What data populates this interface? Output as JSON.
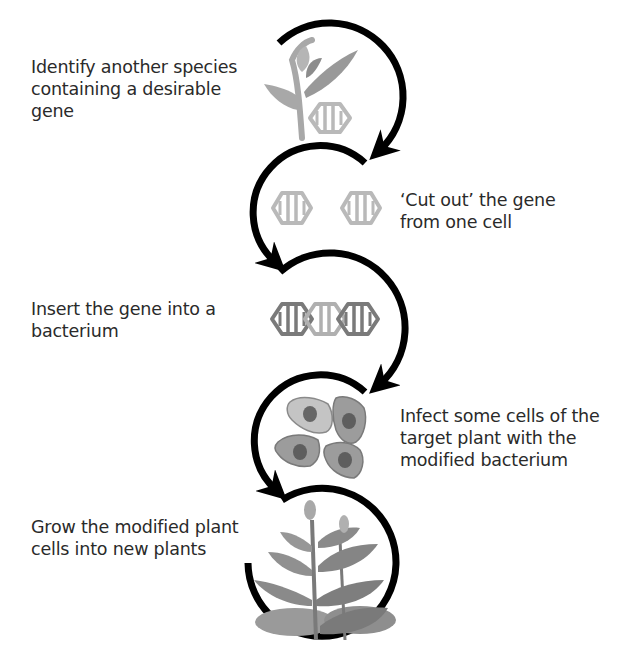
{
  "diagram": {
    "type": "process-flow",
    "title": "",
    "colors": {
      "arrow": "#000000",
      "text": "#2a2a2a",
      "gene_light": "#b9b9b9",
      "gene_dark": "#7a7a7a",
      "plant_light": "#a8a8a8",
      "plant_dark": "#6d6d6d",
      "cell_light": "#c4c4c4",
      "cell_mid": "#9c9c9c",
      "nucleus": "#666666"
    },
    "steps": [
      {
        "id": 1,
        "text": "Identify another species\ncontaining a desirable\ngene",
        "icon": "plant-with-gene-icon",
        "side": "left"
      },
      {
        "id": 2,
        "text": "‘Cut out’ the gene\nfrom one cell",
        "icon": "cut-gene-icon",
        "side": "right"
      },
      {
        "id": 3,
        "text": "Insert the gene into a\nbacterium",
        "icon": "recombinant-dna-icon",
        "side": "left"
      },
      {
        "id": 4,
        "text": "Infect some cells of the\ntarget plant with the\nmodified bacterium",
        "icon": "plant-cells-icon",
        "side": "right"
      },
      {
        "id": 5,
        "text": "Grow the modified plant\ncells into new plants",
        "icon": "grown-plant-icon",
        "side": "left"
      }
    ]
  }
}
